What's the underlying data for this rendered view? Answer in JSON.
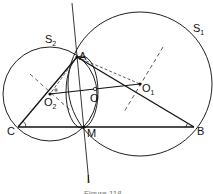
{
  "figure": {
    "type": "geometry-diagram",
    "caption": "Figure 118",
    "points": {
      "A": {
        "label": "A",
        "x": 77,
        "y": 57
      },
      "B": {
        "label": "B",
        "x": 194,
        "y": 127
      },
      "C": {
        "label": "C",
        "x": 18,
        "y": 127
      },
      "M": {
        "label": "M",
        "x": 84,
        "y": 127
      },
      "O": {
        "label": "O",
        "x": 95,
        "y": 89
      },
      "O1": {
        "label": "O",
        "sub": "1",
        "x": 140,
        "y": 84
      },
      "O2": {
        "label": "O",
        "sub": "2",
        "x": 50,
        "y": 94
      }
    },
    "circles": {
      "S1": {
        "label": "S",
        "sub": "1",
        "cx": 140,
        "cy": 84,
        "r": 72
      },
      "S2": {
        "label": "S",
        "sub": "2",
        "cx": 50,
        "cy": 94,
        "r": 47
      }
    },
    "line_l": {
      "label": "l"
    }
  }
}
